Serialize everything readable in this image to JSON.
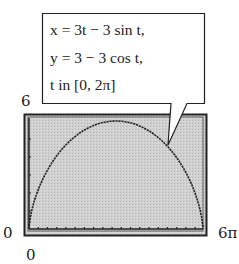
{
  "chart_data": {
    "type": "line",
    "title": "",
    "equations": [
      "x = 3t − 3 sin t,",
      "y = 3 − 3 cos t,",
      "t in [0, 2π]"
    ],
    "x_window": {
      "min_label": "0",
      "max_label": "6π",
      "min": 0,
      "max": 18.85
    },
    "y_window": {
      "min_label": "0",
      "max_label": "6",
      "min": 0,
      "max": 6
    },
    "xlabel": "",
    "ylabel": "",
    "grid": false,
    "series": [
      {
        "name": "cycloid",
        "x": [
          0,
          0.08,
          0.61,
          1.95,
          4.24,
          7.42,
          9.42,
          11.42,
          14.6,
          16.9,
          18.23,
          18.77,
          18.85
        ],
        "y": [
          0,
          0.37,
          1.38,
          2.85,
          4.29,
          5.55,
          6.0,
          5.55,
          4.29,
          2.85,
          1.38,
          0.37,
          0
        ]
      }
    ]
  },
  "labels": {
    "y_max": "6",
    "x_min": "0",
    "y_min": "0",
    "x_max": "6π"
  },
  "callout": {
    "line1": "x = 3t − 3 sin t,",
    "line2": "y = 3 − 3 cos t,",
    "line3": "t in [0, 2π]"
  }
}
